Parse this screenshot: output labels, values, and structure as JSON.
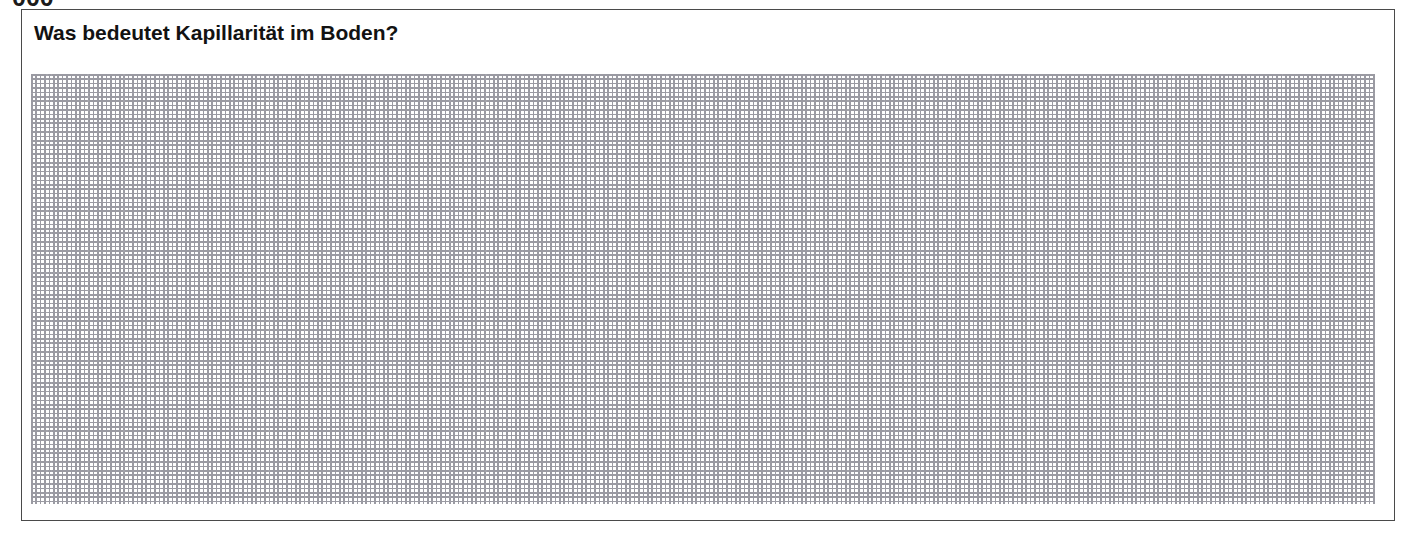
{
  "page": {
    "background_color": "#ffffff",
    "clipped_text_above": "000"
  },
  "answer_card": {
    "title": "Was bedeutet Kapillarität im Boden?",
    "border_color": "#4a4a4a",
    "background_color": "#ffffff",
    "grid": {
      "type": "dotted-graph-paper",
      "line_color": "#9a9aa2",
      "cell_width_px": 36,
      "cell_height_px": 36,
      "columns": 37,
      "rows": 12,
      "content": ""
    }
  }
}
